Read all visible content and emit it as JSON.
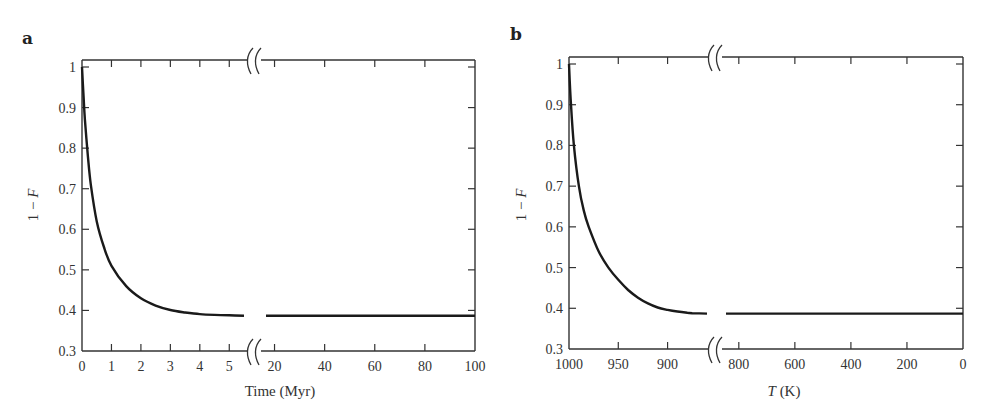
{
  "figure": {
    "panels": [
      {
        "id": "a",
        "label": "a"
      },
      {
        "id": "b",
        "label": "b"
      }
    ]
  },
  "chart_data": [
    {
      "type": "line",
      "panel": "a",
      "title": "",
      "xlabel": "Time (Myr)",
      "ylabel": "1 − F",
      "ylim": [
        0.3,
        1.0
      ],
      "yticks": [
        0.3,
        0.4,
        0.5,
        0.6,
        0.7,
        0.8,
        0.9,
        1
      ],
      "ytick_labels": [
        "0.3",
        "0.4",
        "0.5",
        "0.6",
        "0.7",
        "0.8",
        "0.9",
        "1"
      ],
      "x_axis_break": true,
      "x_segments": [
        {
          "range": [
            0,
            5.5
          ],
          "ticks": [
            0,
            1,
            2,
            3,
            4,
            5
          ],
          "tick_labels": [
            "0",
            "1",
            "2",
            "3",
            "4",
            "5"
          ]
        },
        {
          "range": [
            15,
            100
          ],
          "ticks": [
            20,
            40,
            60,
            80,
            100
          ],
          "tick_labels": [
            "20",
            "40",
            "60",
            "80",
            "100"
          ]
        }
      ],
      "grid": false,
      "series": [
        {
          "name": "1 − F",
          "x": [
            0,
            0.05,
            0.1,
            0.2,
            0.3,
            0.5,
            0.75,
            1.0,
            1.5,
            2.0,
            2.5,
            3.0,
            3.5,
            4.0,
            4.5,
            5.0,
            5.5,
            15,
            20,
            40,
            60,
            80,
            100
          ],
          "y": [
            1.0,
            0.93,
            0.87,
            0.78,
            0.71,
            0.62,
            0.555,
            0.51,
            0.46,
            0.43,
            0.412,
            0.401,
            0.395,
            0.391,
            0.389,
            0.388,
            0.387,
            0.387,
            0.387,
            0.387,
            0.387,
            0.387,
            0.387
          ]
        }
      ]
    },
    {
      "type": "line",
      "panel": "b",
      "title": "",
      "xlabel": "T (K)",
      "ylabel": "1 − F",
      "ylim": [
        0.3,
        1.0
      ],
      "yticks": [
        0.3,
        0.4,
        0.5,
        0.6,
        0.7,
        0.8,
        0.9,
        1
      ],
      "ytick_labels": [
        "0.3",
        "0.4",
        "0.5",
        "0.6",
        "0.7",
        "0.8",
        "0.9",
        "1"
      ],
      "x_axis_break": true,
      "x_reversed": true,
      "x_segments": [
        {
          "range": [
            1000,
            860
          ],
          "ticks": [
            1000,
            950,
            900
          ],
          "tick_labels": [
            "1000",
            "950",
            "900"
          ]
        },
        {
          "range": [
            860,
            0
          ],
          "ticks": [
            800,
            600,
            400,
            200,
            0
          ],
          "tick_labels": [
            "800",
            "600",
            "400",
            "200",
            "0"
          ]
        }
      ],
      "grid": false,
      "series": [
        {
          "name": "1 − F",
          "x": [
            1000,
            998,
            995,
            990,
            985,
            980,
            970,
            960,
            950,
            940,
            930,
            920,
            910,
            900,
            890,
            880,
            875,
            860,
            800,
            600,
            400,
            200,
            0
          ],
          "y": [
            1.0,
            0.9,
            0.8,
            0.7,
            0.64,
            0.6,
            0.54,
            0.5,
            0.47,
            0.445,
            0.426,
            0.412,
            0.402,
            0.396,
            0.392,
            0.389,
            0.388,
            0.387,
            0.387,
            0.387,
            0.387,
            0.387,
            0.387
          ]
        }
      ]
    }
  ]
}
